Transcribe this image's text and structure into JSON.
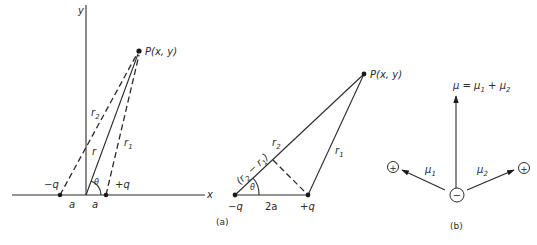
{
  "figure": {
    "left_panel": {
      "axes": {
        "x_label": "x",
        "y_label": "y"
      },
      "point_label": "P(x, y)",
      "negative_charge_label": "−q",
      "positive_charge_label": "+q",
      "distance_left_label": "a",
      "distance_right_label": "a",
      "r_label": "r",
      "r1_label": "r",
      "r1_sub": "1",
      "r2_label": "r",
      "r2_sub": "2",
      "angle_label": "θ"
    },
    "panel_a": {
      "point_label": "P(x, y)",
      "negative_charge_label": "−q",
      "positive_charge_label": "+q",
      "separation_label": "2a",
      "r1_label": "r",
      "r1_sub": "1",
      "r2_label": "r",
      "r2_sub": "2",
      "difference_label_open": "(r",
      "difference_sub2": "2",
      "difference_mid": " − r",
      "difference_sub1": "1",
      "difference_close": ")",
      "angle_label": "θ",
      "caption": "(a)"
    },
    "panel_b": {
      "resultant_label_mu": "μ = μ",
      "resultant_sub1": "1",
      "resultant_plus": " + μ",
      "resultant_sub2": "2",
      "mu1_label": "μ",
      "mu1_sub": "1",
      "mu2_label": "μ",
      "mu2_sub": "2",
      "center_charge_symbol": "−",
      "left_charge_symbol": "+",
      "right_charge_symbol": "+",
      "caption": "(b)"
    }
  }
}
